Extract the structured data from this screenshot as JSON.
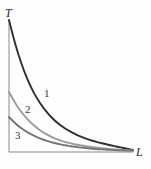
{
  "figure": {
    "background_color": "#fdfdfd",
    "axes": {
      "y_axis_label": "T",
      "x_axis_label": "L",
      "axis_color": "#8a8a8a",
      "origin_px": {
        "x": 9,
        "y": 152
      },
      "y_axis_top_px": {
        "x": 9,
        "y": 20
      },
      "x_axis_right_px": {
        "x": 133,
        "y": 152
      }
    },
    "curve_labels": [
      {
        "id": "1",
        "text": "1"
      },
      {
        "id": "2",
        "text": "2"
      },
      {
        "id": "3",
        "text": "3"
      }
    ]
  },
  "chart_data": {
    "type": "line",
    "title": "",
    "xlabel": "L",
    "ylabel": "T",
    "grid": false,
    "legend_position": "inline-curve-labels",
    "xlim": [
      0,
      1
    ],
    "ylim": [
      0,
      1
    ],
    "axis_ticks": {
      "x": [],
      "y": []
    },
    "annotations": [
      {
        "text": "T",
        "role": "y-axis-name",
        "at": [
          0.0,
          1.05
        ]
      },
      {
        "text": "L",
        "role": "x-axis-name",
        "at": [
          1.03,
          0.0
        ]
      },
      {
        "text": "1",
        "role": "curve-label",
        "at": [
          0.3,
          0.5
        ]
      },
      {
        "text": "2",
        "role": "curve-label",
        "at": [
          0.14,
          0.37
        ]
      },
      {
        "text": "3",
        "role": "curve-label",
        "at": [
          0.06,
          0.17
        ]
      }
    ],
    "series": [
      {
        "name": "1",
        "color": "#2f2f2f",
        "width_px": 1.9,
        "start": [
          0.0,
          1.0
        ],
        "end": [
          1.0,
          0.015
        ],
        "x": [
          0.0,
          0.05,
          0.1,
          0.15,
          0.2,
          0.25,
          0.3,
          0.35,
          0.4,
          0.45,
          0.5,
          0.55,
          0.6,
          0.65,
          0.7,
          0.75,
          0.8,
          0.85,
          0.9,
          0.95,
          1.0
        ],
        "values": [
          1.0,
          0.82,
          0.67,
          0.548,
          0.45,
          0.372,
          0.308,
          0.256,
          0.214,
          0.18,
          0.152,
          0.128,
          0.109,
          0.092,
          0.078,
          0.066,
          0.055,
          0.045,
          0.035,
          0.025,
          0.015
        ]
      },
      {
        "name": "2",
        "color": "#9b9b9b",
        "width_px": 1.9,
        "start": [
          0.0,
          0.455
        ],
        "end": [
          1.0,
          0.012
        ],
        "x": [
          0.0,
          0.05,
          0.1,
          0.15,
          0.2,
          0.25,
          0.3,
          0.35,
          0.4,
          0.45,
          0.5,
          0.55,
          0.6,
          0.65,
          0.7,
          0.75,
          0.8,
          0.85,
          0.9,
          0.95,
          1.0
        ],
        "values": [
          0.455,
          0.372,
          0.303,
          0.247,
          0.202,
          0.165,
          0.135,
          0.111,
          0.092,
          0.077,
          0.065,
          0.055,
          0.047,
          0.04,
          0.034,
          0.029,
          0.024,
          0.02,
          0.017,
          0.014,
          0.012
        ]
      },
      {
        "name": "3",
        "color": "#767676",
        "width_px": 1.9,
        "start": [
          0.0,
          0.265
        ],
        "end": [
          1.0,
          0.01
        ],
        "x": [
          0.0,
          0.05,
          0.1,
          0.15,
          0.2,
          0.25,
          0.3,
          0.35,
          0.4,
          0.45,
          0.5,
          0.55,
          0.6,
          0.65,
          0.7,
          0.75,
          0.8,
          0.85,
          0.9,
          0.95,
          1.0
        ],
        "values": [
          0.265,
          0.218,
          0.18,
          0.149,
          0.124,
          0.103,
          0.086,
          0.072,
          0.061,
          0.051,
          0.044,
          0.037,
          0.032,
          0.027,
          0.023,
          0.02,
          0.017,
          0.014,
          0.012,
          0.011,
          0.01
        ]
      }
    ]
  }
}
